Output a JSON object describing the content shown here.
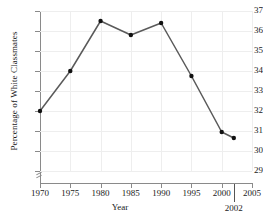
{
  "chart_data": {
    "type": "line",
    "title": "",
    "xlabel": "Year",
    "ylabel": "Percentage of White Classmates",
    "x": [
      1970,
      1975,
      1980,
      1985,
      1990,
      1995,
      2000,
      2002
    ],
    "values": [
      32.0,
      34.0,
      36.5,
      35.8,
      36.4,
      33.75,
      30.95,
      30.65
    ],
    "series": [
      {
        "name": "Percentage of White Classmates",
        "x": [
          1970,
          1975,
          1980,
          1985,
          1990,
          1995,
          2000,
          2002
        ],
        "values": [
          32.0,
          34.0,
          36.5,
          35.8,
          36.4,
          33.75,
          30.95,
          30.65
        ]
      }
    ],
    "xlim": [
      1970,
      2005
    ],
    "ylim": [
      29,
      37
    ],
    "xticks": [
      1970,
      1975,
      1980,
      1985,
      1990,
      1995,
      2000,
      2005
    ],
    "xtick_labels": [
      "1970",
      "1975",
      "1980",
      "1985",
      "1990",
      "1995",
      "2000",
      "2005"
    ],
    "yticks": [
      29,
      30,
      31,
      32,
      33,
      34,
      35,
      36,
      37
    ],
    "ytick_labels": [
      "29",
      "30",
      "31",
      "32",
      "33",
      "34",
      "35",
      "36",
      "37"
    ],
    "grid": true,
    "legend": false,
    "legend_position": "none",
    "axis_break_y": true,
    "annotations": [
      {
        "label": "2002",
        "x": 2002,
        "kind": "x-axis-marker"
      }
    ],
    "colors": {
      "line": "#5a5a5a",
      "marker": "#111111",
      "grid": "#eeeeee",
      "axis": "#8a8a8a",
      "text": "#1a1a1a",
      "background": "#ffffff"
    }
  }
}
